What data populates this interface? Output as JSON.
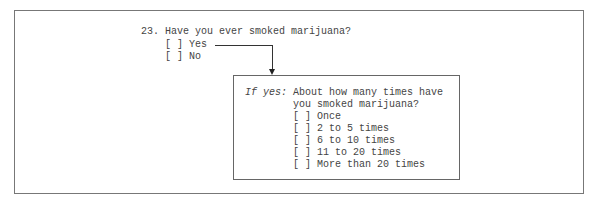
{
  "question": {
    "number": "23.",
    "text": "Have you ever smoked marijuana?",
    "options": [
      {
        "box": "[ ]",
        "label": "Yes"
      },
      {
        "box": "[ ]",
        "label": "No"
      }
    ]
  },
  "followup": {
    "condition": "If yes:",
    "text_line1": "About how many times have",
    "text_line2": "you smoked marijuana?",
    "options": [
      {
        "box": "[ ]",
        "label": "Once"
      },
      {
        "box": "[ ]",
        "label": "2 to 5 times"
      },
      {
        "box": "[ ]",
        "label": "6 to 10 times"
      },
      {
        "box": "[ ]",
        "label": "11 to 20 times"
      },
      {
        "box": "[ ]",
        "label": "More than 20 times"
      }
    ]
  }
}
